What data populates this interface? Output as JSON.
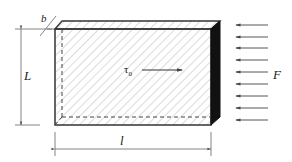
{
  "diagram": {
    "labels": {
      "thickness": "b",
      "height": "L",
      "length": "l",
      "shear_stress": "τ",
      "shear_stress_sub": "0",
      "force": "F"
    },
    "colors": {
      "outline": "#333333",
      "hatch": "#b8b8b8",
      "side_face": "#111111",
      "dim_line": "#555555",
      "arrow": "#444444"
    },
    "force_arrow_count": 9
  }
}
